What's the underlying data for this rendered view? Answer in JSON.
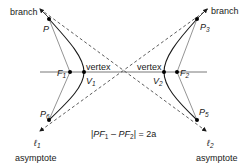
{
  "diagram": {
    "labels": {
      "branch_left": "branch",
      "branch_right": "branch",
      "vertex_left": "vertex",
      "vertex_right": "vertex",
      "asymptote_left": "asymptote",
      "asymptote_right": "asymptote"
    },
    "points": {
      "P": {
        "name": "P",
        "sub": ""
      },
      "P3": {
        "name": "P",
        "sub": "3"
      },
      "P5": {
        "name": "P",
        "sub": "5"
      },
      "P6": {
        "name": "P",
        "sub": "6"
      },
      "F1": {
        "name": "F",
        "sub": "1"
      },
      "F2": {
        "name": "F",
        "sub": "2"
      },
      "V1": {
        "name": "V",
        "sub": "1"
      },
      "V2": {
        "name": "V",
        "sub": "2"
      }
    },
    "asymptotes": {
      "l1": {
        "name": "ℓ",
        "sub": "1"
      },
      "l2": {
        "name": "ℓ",
        "sub": "2"
      }
    },
    "equation": {
      "open": "|",
      "a": "PF",
      "a_sub": "1",
      "minus": " – ",
      "b": "PF",
      "b_sub": "2",
      "close": "| = 2a"
    },
    "colors": {
      "curve": "#1a1a1a",
      "focal_lines": "#888888",
      "asymptote": "#333333",
      "axis": "#555555"
    }
  }
}
